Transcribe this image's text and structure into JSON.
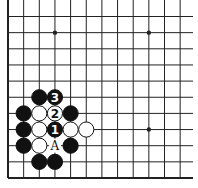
{
  "diagram": {
    "type": "go-board",
    "region": "lower-left corner",
    "columns": 12,
    "rows": 11,
    "edges": [
      "left",
      "bottom"
    ],
    "star_points": [
      {
        "col": 3,
        "row": 1
      },
      {
        "col": 9,
        "row": 1
      },
      {
        "col": 9,
        "row": 7
      }
    ],
    "stones": [
      {
        "color": "black",
        "col": 2,
        "row": 5,
        "label": ""
      },
      {
        "color": "black",
        "col": 3,
        "row": 5,
        "label": "3"
      },
      {
        "color": "black",
        "col": 1,
        "row": 6,
        "label": ""
      },
      {
        "color": "white",
        "col": 2,
        "row": 6,
        "label": ""
      },
      {
        "color": "white",
        "col": 3,
        "row": 6,
        "label": "2"
      },
      {
        "color": "black",
        "col": 4,
        "row": 6,
        "label": ""
      },
      {
        "color": "black",
        "col": 1,
        "row": 7,
        "label": ""
      },
      {
        "color": "white",
        "col": 2,
        "row": 7,
        "label": ""
      },
      {
        "color": "black",
        "col": 3,
        "row": 7,
        "label": "1"
      },
      {
        "color": "white",
        "col": 4,
        "row": 7,
        "label": ""
      },
      {
        "color": "white",
        "col": 5,
        "row": 7,
        "label": ""
      },
      {
        "color": "black",
        "col": 1,
        "row": 8,
        "label": ""
      },
      {
        "color": "white",
        "col": 2,
        "row": 8,
        "label": ""
      },
      {
        "color": "black",
        "col": 4,
        "row": 8,
        "label": ""
      },
      {
        "color": "black",
        "col": 2,
        "row": 9,
        "label": ""
      },
      {
        "color": "black",
        "col": 3,
        "row": 9,
        "label": ""
      }
    ],
    "markers": [
      {
        "col": 3,
        "row": 8,
        "label": "A"
      }
    ],
    "colors": {
      "line": "#222222",
      "black_stone": "#111111",
      "white_stone": "#ffffff",
      "background": "#ffffff"
    }
  }
}
